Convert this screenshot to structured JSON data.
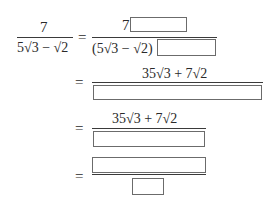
{
  "equation": {
    "lhs": {
      "numerator": "7",
      "denominator": "5√3 − √2"
    },
    "equals": "=",
    "step1": {
      "numerator_prefix": "7",
      "numerator_blank": "",
      "denominator_prefix": "(5√3 − √2)",
      "denominator_blank": ""
    },
    "step2": {
      "numerator": "35√3 + 7√2",
      "denominator_blank": ""
    },
    "step3": {
      "numerator": "35√3 + 7√2",
      "denominator_blank": ""
    },
    "step4": {
      "numerator_blank": "",
      "denominator_blank": ""
    }
  }
}
